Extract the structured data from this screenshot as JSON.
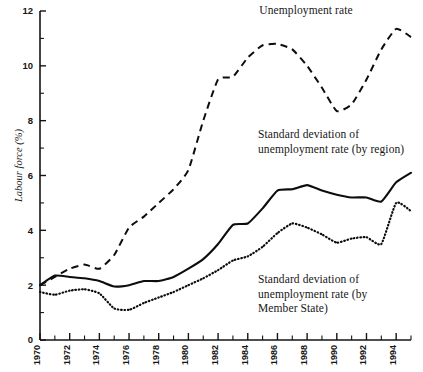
{
  "chart_data": {
    "type": "line",
    "title": "",
    "xlabel": "",
    "ylabel": "Labour force (%)",
    "xlim": [
      1970,
      1995
    ],
    "ylim": [
      0,
      12
    ],
    "grid": false,
    "legend_position": "inline-annotations",
    "x": [
      1970,
      1971,
      1972,
      1973,
      1974,
      1975,
      1976,
      1977,
      1978,
      1979,
      1980,
      1981,
      1982,
      1983,
      1984,
      1985,
      1986,
      1987,
      1988,
      1989,
      1990,
      1991,
      1992,
      1993,
      1994,
      1995
    ],
    "y_major_ticks": [
      0,
      2,
      4,
      6,
      8,
      10,
      12
    ],
    "y_minor_ticks": [
      1,
      3,
      5,
      7,
      9,
      11
    ],
    "x_tick_labels": [
      "1970",
      "1972",
      "1974",
      "1976",
      "1978",
      "1980",
      "1982",
      "1984",
      "1986",
      "1988",
      "1990",
      "1992",
      "1994"
    ],
    "x_tick_values": [
      1970,
      1972,
      1974,
      1976,
      1978,
      1980,
      1982,
      1984,
      1986,
      1988,
      1990,
      1992,
      1994
    ],
    "series": [
      {
        "name": "Unemployment rate",
        "style": "dashed",
        "color": "#0d0d0d",
        "values": [
          2.0,
          2.3,
          2.6,
          2.75,
          2.6,
          3.1,
          4.1,
          4.5,
          5.0,
          5.5,
          6.2,
          8.0,
          9.5,
          9.6,
          10.3,
          10.75,
          10.8,
          10.6,
          10.0,
          9.2,
          8.35,
          8.6,
          9.5,
          10.6,
          11.35,
          11.05
        ]
      },
      {
        "name": "Standard deviation of unemployment rate (by region)",
        "style": "solid",
        "color": "#0d0d0d",
        "values": [
          2.0,
          2.35,
          2.3,
          2.25,
          2.15,
          1.95,
          2.0,
          2.15,
          2.15,
          2.3,
          2.6,
          2.95,
          3.5,
          4.2,
          4.25,
          4.8,
          5.45,
          5.5,
          5.65,
          5.45,
          5.3,
          5.2,
          5.2,
          5.05,
          5.75,
          6.1
        ]
      },
      {
        "name": "Standard deviation of unemployment rate (by Member State)",
        "style": "dotted",
        "color": "#0d0d0d",
        "values": [
          1.75,
          1.65,
          1.8,
          1.85,
          1.7,
          1.15,
          1.1,
          1.35,
          1.55,
          1.75,
          2.0,
          2.25,
          2.55,
          2.9,
          3.05,
          3.4,
          3.9,
          4.25,
          4.1,
          3.85,
          3.55,
          3.7,
          3.75,
          3.5,
          5.0,
          4.7
        ]
      }
    ],
    "annotations": [
      {
        "id": "unemployment",
        "text": "Unemployment rate"
      },
      {
        "id": "region",
        "text": "Standard deviation of\nunemployment rate (by region)"
      },
      {
        "id": "member",
        "text": "Standard deviation of\nunemployment rate (by\nMember State)"
      }
    ]
  }
}
